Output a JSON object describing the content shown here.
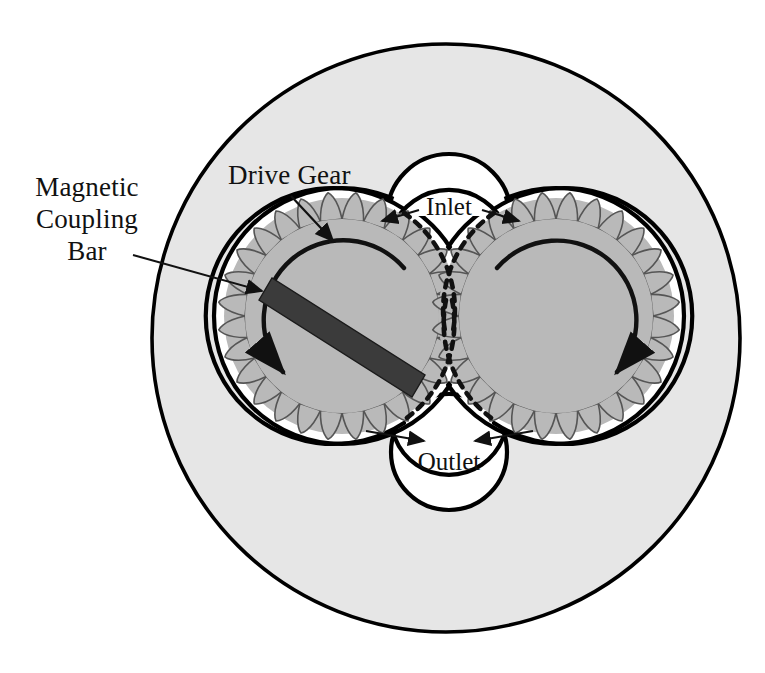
{
  "figure": {
    "type": "technical-diagram",
    "width": 765,
    "height": 673,
    "background": "#ffffff"
  },
  "colors": {
    "page_background": "#ffffff",
    "housing_fill": "#e6e6e6",
    "chamber_fill": "#ffffff",
    "gear_fill": "#b9b9b9",
    "bar_fill": "#3b3b3b",
    "outline": "#000000",
    "leader": "#1a1a1a"
  },
  "labels": {
    "magnetic_coupling_bar": {
      "line1": "Magnetic",
      "line2": "Coupling",
      "line3": "Bar"
    },
    "drive_gear": "Drive Gear",
    "inlet": "Inlet",
    "outlet": "Outlet"
  },
  "components": {
    "outer_housing": {
      "name": "Outer housing / magnet can",
      "cx": 446,
      "cy": 338,
      "r": 294,
      "fill": "#e6e6e6"
    },
    "pump_chamber": {
      "name": "Figure-eight pump chamber",
      "left_circle": {
        "cx": 342,
        "cy": 316,
        "r": 128
      },
      "right_circle": {
        "cx": 556,
        "cy": 316,
        "r": 128
      }
    },
    "inlet_port": {
      "name": "Inlet port cavity",
      "cx": 449,
      "cy": 216,
      "r": 62,
      "position": "top-center"
    },
    "outlet_port": {
      "name": "Outlet port cavity",
      "cx": 449,
      "cy": 452,
      "r": 58,
      "position": "bottom-center"
    },
    "left_gear": {
      "name": "Drive gear (left)",
      "cx": 342,
      "cy": 316,
      "root_radius": 97,
      "tip_radius": 118,
      "teeth": 28,
      "rotation": "counter-clockwise"
    },
    "right_gear": {
      "name": "Driven gear (right)",
      "cx": 556,
      "cy": 316,
      "root_radius": 97,
      "tip_radius": 118,
      "teeth": 28,
      "rotation": "clockwise"
    },
    "coupling_bar": {
      "name": "Magnetic coupling bar",
      "x1": 266,
      "y1": 289,
      "x2": 416,
      "y2": 384,
      "thickness": 26,
      "fill": "#3b3b3b"
    }
  },
  "annotations": {
    "drive_gear_leader": {
      "from_x": 292,
      "from_y": 190,
      "to_x": 331,
      "to_y": 243
    },
    "bar_leader": {
      "from_x": 131,
      "from_y": 254,
      "to_x": 266,
      "to_y": 293
    },
    "inlet_leader_left": {
      "from_x": 418,
      "from_y": 207,
      "to_x": 381,
      "to_y": 219
    },
    "inlet_leader_right": {
      "from_x": 492,
      "from_y": 207,
      "to_x": 518,
      "to_y": 219
    },
    "outlet_leader_left": {
      "from_x": 368,
      "from_y": 430,
      "to_x": 421,
      "to_y": 441
    },
    "outlet_leader_right": {
      "from_x": 532,
      "from_y": 430,
      "to_x": 479,
      "to_y": 441
    }
  }
}
